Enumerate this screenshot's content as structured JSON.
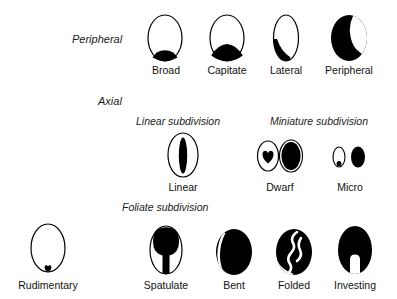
{
  "figure": {
    "background_color": "#ffffff",
    "ink_color": "#000000",
    "width": 397,
    "height": 299
  },
  "groups": [
    {
      "id": "peripheral",
      "label": "Peripheral"
    },
    {
      "id": "axial",
      "label": "Axial"
    }
  ],
  "subdivisions": [
    {
      "id": "linear",
      "label": "Linear subdivision"
    },
    {
      "id": "miniature",
      "label": "Miniature subdivision"
    },
    {
      "id": "foliate",
      "label": "Foliate subdivision"
    }
  ],
  "specimens": [
    {
      "id": "broad",
      "caption": "Broad",
      "group": "peripheral",
      "shape": "outline-oval-basal-bulge"
    },
    {
      "id": "capitate",
      "caption": "Capitate",
      "group": "peripheral",
      "shape": "outline-oval-basal-cap"
    },
    {
      "id": "lateral",
      "caption": "Lateral",
      "group": "peripheral",
      "shape": "outline-oval-lateral-wedge"
    },
    {
      "id": "peripheral",
      "caption": "Peripheral",
      "group": "peripheral",
      "shape": "filled-oval-white-notch"
    },
    {
      "id": "linear",
      "caption": "Linear",
      "group": "axial",
      "subdivision": "linear",
      "shape": "outline-oval-axial-spindle"
    },
    {
      "id": "dwarf",
      "caption": "Dwarf",
      "group": "axial",
      "subdivision": "miniature",
      "shape": "pair-small-outline-blob-and-filled"
    },
    {
      "id": "micro",
      "caption": "Micro",
      "group": "axial",
      "subdivision": "miniature",
      "shape": "pair-tiny-outline-dot-and-filled"
    },
    {
      "id": "rudimentary",
      "caption": "Rudimentary",
      "group": "axial",
      "shape": "outline-oval-minute-dot"
    },
    {
      "id": "spatulate",
      "caption": "Spatulate",
      "group": "axial",
      "subdivision": "foliate",
      "shape": "outline-oval-paddle"
    },
    {
      "id": "bent",
      "caption": "Bent",
      "group": "axial",
      "subdivision": "foliate",
      "shape": "filled-oval-white-crescent"
    },
    {
      "id": "folded",
      "caption": "Folded",
      "group": "axial",
      "subdivision": "foliate",
      "shape": "filled-oval-white-swirl"
    },
    {
      "id": "investing",
      "caption": "Investing",
      "group": "axial",
      "subdivision": "foliate",
      "shape": "filled-oval-white-basal-tab"
    }
  ]
}
